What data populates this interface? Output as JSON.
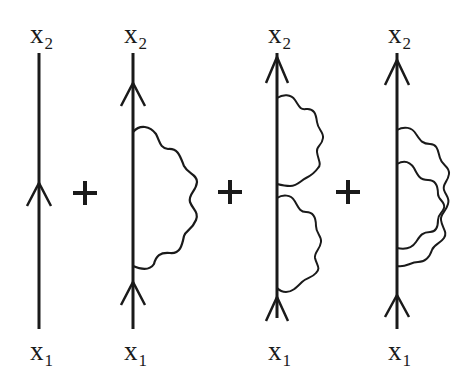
{
  "figure": {
    "type": "feynman_diagram_series",
    "stroke_color": "#1a1a1a",
    "background": "#ffffff",
    "operator_symbol": "+",
    "diagrams": [
      {
        "id": "free-propagator",
        "top_label": {
          "var": "x",
          "sub": "2"
        },
        "bottom_label": {
          "var": "x",
          "sub": "1"
        },
        "fermion_arrows": 1,
        "photon_loops": 0,
        "loop_arrangement": "none"
      },
      {
        "id": "one-loop-self-energy",
        "top_label": {
          "var": "x",
          "sub": "2"
        },
        "bottom_label": {
          "var": "x",
          "sub": "1"
        },
        "fermion_arrows": 2,
        "photon_loops": 1,
        "loop_arrangement": "single"
      },
      {
        "id": "two-loop-sequential",
        "top_label": {
          "var": "x",
          "sub": "2"
        },
        "bottom_label": {
          "var": "x",
          "sub": "1"
        },
        "fermion_arrows": 2,
        "photon_loops": 2,
        "loop_arrangement": "sequential"
      },
      {
        "id": "two-loop-overlapping",
        "top_label": {
          "var": "x",
          "sub": "2"
        },
        "bottom_label": {
          "var": "x",
          "sub": "1"
        },
        "fermion_arrows": 2,
        "photon_loops": 2,
        "loop_arrangement": "overlapping"
      }
    ]
  }
}
